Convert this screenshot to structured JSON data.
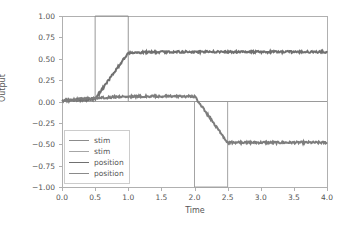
{
  "chart_data": {
    "type": "line",
    "title": "",
    "xlabel": "Time",
    "ylabel": "Output",
    "xlim": [
      0.0,
      4.0
    ],
    "ylim": [
      -1.0,
      1.0
    ],
    "grid": false,
    "legend_position": "lower left",
    "xticks": [
      0.0,
      0.5,
      1.0,
      1.5,
      2.0,
      2.5,
      3.0,
      3.5,
      4.0
    ],
    "xticklabels": [
      "0.0",
      "0.5",
      "1.0",
      "1.5",
      "2.0",
      "2.5",
      "3.0",
      "3.5",
      "4.0"
    ],
    "yticks": [
      1.0,
      0.75,
      0.5,
      0.25,
      0.0,
      -0.25,
      -0.5,
      -0.75,
      -1.0
    ],
    "yticklabels": [
      "1.00",
      "0.75",
      "0.50",
      "0.25",
      "0.00",
      "−0.25",
      "−0.50",
      "−0.75",
      "−1.00"
    ],
    "series": [
      {
        "name": "stim",
        "color": "#8c8c8c",
        "linewidth": 0.9,
        "noisy": false,
        "x": [
          0.0,
          0.5,
          0.5,
          1.0,
          1.0,
          4.0
        ],
        "values": [
          0.0,
          0.0,
          1.0,
          1.0,
          0.0,
          0.0
        ]
      },
      {
        "name": "stim",
        "color": "#9a9a9a",
        "linewidth": 0.9,
        "noisy": false,
        "x": [
          0.0,
          2.0,
          2.0,
          2.5,
          2.5,
          4.0
        ],
        "values": [
          0.0,
          0.0,
          -1.0,
          -1.0,
          0.0,
          0.0
        ]
      },
      {
        "name": "position",
        "color": "#707070",
        "linewidth": 2.0,
        "noisy": true,
        "noise": 0.012,
        "x": [
          0.0,
          0.5,
          1.0,
          1.5,
          2.0,
          2.5,
          3.0,
          3.5,
          4.0
        ],
        "values": [
          0.01,
          0.03,
          0.57,
          0.58,
          0.58,
          0.58,
          0.58,
          0.58,
          0.58
        ]
      },
      {
        "name": "position",
        "color": "#7d7d7d",
        "linewidth": 2.0,
        "noisy": true,
        "noise": 0.012,
        "x": [
          0.0,
          0.5,
          1.0,
          1.5,
          2.0,
          2.5,
          3.0,
          3.5,
          4.0
        ],
        "values": [
          0.01,
          0.04,
          0.06,
          0.06,
          0.06,
          -0.48,
          -0.48,
          -0.48,
          -0.48
        ]
      }
    ],
    "legend": [
      {
        "label": "stim",
        "color": "#8c8c8c",
        "linewidth": 1.4
      },
      {
        "label": "stim",
        "color": "#a6a6a6",
        "linewidth": 1.4
      },
      {
        "label": "position",
        "color": "#707070",
        "linewidth": 1.8
      },
      {
        "label": "position",
        "color": "#8a8a8a",
        "linewidth": 1.8
      }
    ]
  }
}
